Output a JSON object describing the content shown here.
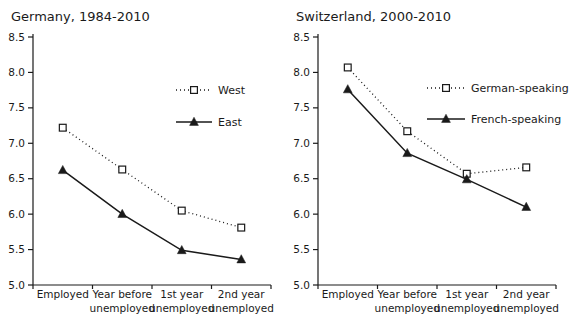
{
  "colors": {
    "ink": "#1a1a1a",
    "background": "#ffffff",
    "marker_fill": "#ffffff"
  },
  "chart_data": [
    {
      "type": "line",
      "title": "Germany, 1984-2010",
      "categories": [
        "Employed",
        "Year before\nunemployed",
        "1st year\nunemployed",
        "2nd year\nunemployed"
      ],
      "xlabel": "",
      "ylabel": "",
      "ylim": [
        5.0,
        8.5
      ],
      "ytick_step": 0.5,
      "ytick_labels": [
        "8.5",
        "8.0",
        "7.5",
        "7.0",
        "6.5",
        "6.0",
        "5.5",
        "5.0"
      ],
      "grid": false,
      "legend_position": "upper-right-inside",
      "series": [
        {
          "name": "West",
          "line_style": "dotted",
          "marker": "open-square",
          "color": "#1a1a1a",
          "values": [
            7.22,
            6.63,
            6.05,
            5.81
          ]
        },
        {
          "name": "East",
          "line_style": "solid",
          "marker": "filled-triangle",
          "color": "#1a1a1a",
          "values": [
            6.62,
            6.0,
            5.49,
            5.36
          ]
        }
      ]
    },
    {
      "type": "line",
      "title": "Switzerland, 2000-2010",
      "categories": [
        "Employed",
        "Year before\nunemployed",
        "1st year\nunemployed",
        "2nd year\nunemployed"
      ],
      "xlabel": "",
      "ylabel": "",
      "ylim": [
        5.0,
        8.5
      ],
      "ytick_step": 0.5,
      "ytick_labels": [
        "8.5",
        "8.0",
        "7.5",
        "7.0",
        "6.5",
        "6.0",
        "5.5",
        "5.0"
      ],
      "grid": false,
      "legend_position": "upper-right-inside",
      "series": [
        {
          "name": "German-speaking",
          "line_style": "dotted",
          "marker": "open-square",
          "color": "#1a1a1a",
          "values": [
            8.07,
            7.17,
            6.57,
            6.66
          ]
        },
        {
          "name": "French-speaking",
          "line_style": "solid",
          "marker": "filled-triangle",
          "color": "#1a1a1a",
          "values": [
            7.76,
            6.86,
            6.49,
            6.1
          ]
        }
      ]
    }
  ]
}
